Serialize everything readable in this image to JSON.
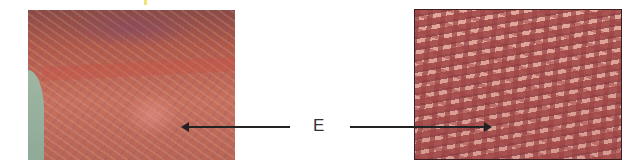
{
  "figure": {
    "left_panel": {
      "description": "low-magnification micrograph, reddish stained tissue"
    },
    "right_panel": {
      "description": "high-magnification micrograph, elongated rod-shaped cells"
    },
    "label": "E",
    "colors": {
      "arrow": "#222222",
      "left_tissue": "#c7705e",
      "right_tissue": "#a4484a",
      "edge_region": "#9fb6a2"
    }
  }
}
